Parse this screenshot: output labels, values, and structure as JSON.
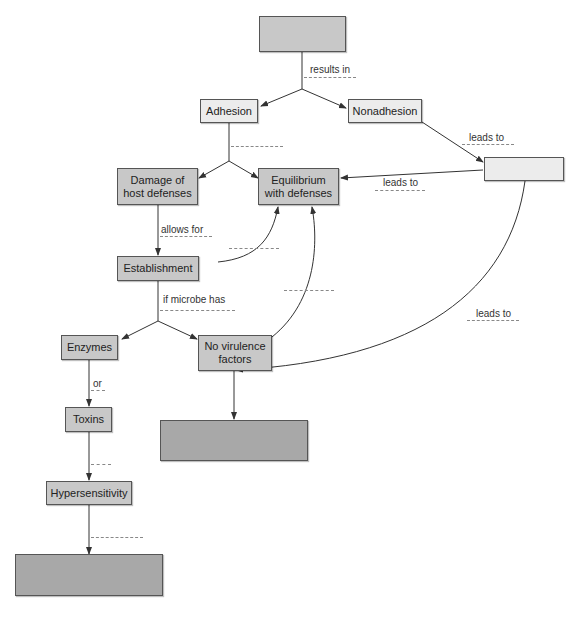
{
  "diagram": {
    "type": "concept-map",
    "nodes": {
      "top_blank": "",
      "adhesion": "Adhesion",
      "nonadhesion": "Nonadhesion",
      "right_blank": "",
      "damage": "Damage of\nhost defenses",
      "equilibrium": "Equilibrium\nwith defenses",
      "establishment": "Establishment",
      "enzymes": "Enzymes",
      "no_virulence": "No virulence\nfactors",
      "toxins": "Toxins",
      "hypersensitivity": "Hypersensitivity",
      "middle_bottom_blank": "",
      "bottom_blank": ""
    },
    "edge_labels": {
      "results_in": "results in",
      "leads_to_1": "leads to",
      "leads_to_2": "leads to",
      "leads_to_3": "leads to",
      "allows_for": "allows for",
      "if_microbe_has": "if microbe has",
      "or": "or"
    },
    "colors": {
      "light_fill": "#ececec",
      "mid_fill": "#c8c8c8",
      "dark_fill": "#a8a8a8",
      "line": "#333333",
      "blank_dash": "#888888"
    }
  }
}
